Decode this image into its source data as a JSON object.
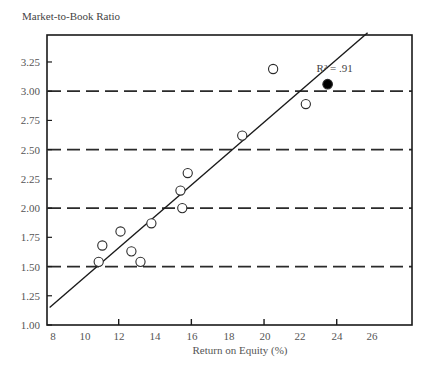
{
  "chart_data": {
    "type": "scatter",
    "title": "",
    "xlabel": "Return on Equity (%)",
    "ylabel": "Market-to-Book Ratio",
    "xlim": [
      8,
      28
    ],
    "ylim": [
      1.0,
      3.5
    ],
    "x_tick_labels": [
      "8",
      "10",
      "12",
      "14",
      "16",
      "18",
      "20",
      "22",
      "24",
      "26"
    ],
    "x_tick_values": [
      8,
      10,
      12,
      14,
      16,
      18,
      20,
      22,
      24,
      26
    ],
    "x_tick_marks": [
      12,
      16,
      20,
      24
    ],
    "y_tick_labels": [
      "1.00",
      "1.25",
      "1.50",
      "1.75",
      "2.00",
      "2.25",
      "2.50",
      "2.75",
      "3.00",
      "3.25"
    ],
    "y_tick_values": [
      1.0,
      1.25,
      1.5,
      1.75,
      2.0,
      2.25,
      2.5,
      2.75,
      3.0,
      3.25
    ],
    "dashed_reference_lines_y": [
      1.5,
      2.0,
      2.5,
      3.0
    ],
    "series": [
      {
        "name": "Companies",
        "marker": "hollow-circle",
        "points": [
          {
            "x": 10.9,
            "y": 1.54
          },
          {
            "x": 11.1,
            "y": 1.68
          },
          {
            "x": 12.1,
            "y": 1.8
          },
          {
            "x": 12.7,
            "y": 1.63
          },
          {
            "x": 13.2,
            "y": 1.54
          },
          {
            "x": 13.8,
            "y": 1.87
          },
          {
            "x": 15.4,
            "y": 2.15
          },
          {
            "x": 15.5,
            "y": 2.0
          },
          {
            "x": 15.8,
            "y": 2.3
          },
          {
            "x": 18.8,
            "y": 2.62
          },
          {
            "x": 20.5,
            "y": 3.19
          },
          {
            "x": 22.3,
            "y": 2.89
          }
        ]
      },
      {
        "name": "Highlighted company",
        "marker": "filled-circle",
        "points": [
          {
            "x": 23.5,
            "y": 3.06
          }
        ]
      }
    ],
    "regression_line": {
      "x1": 8.2,
      "y1": 1.15,
      "x2": 25.7,
      "y2": 3.5
    },
    "annotations": [
      {
        "text": "R² = .91",
        "x": 23.0,
        "y": 3.2
      }
    ],
    "grid": false,
    "legend": null
  },
  "labels": {
    "y_axis_title": "Market-to-Book Ratio",
    "x_axis_title": "Return on Equity (%)",
    "r_squared": "R² = .91"
  }
}
